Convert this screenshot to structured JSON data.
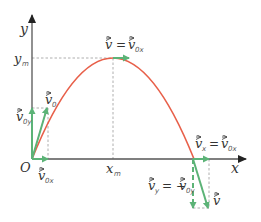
{
  "diagram": {
    "type": "projectile-motion",
    "colors": {
      "axis": "#555555",
      "trajectory": "#e8604a",
      "vector": "#5cb377",
      "guide": "#9a9a9a",
      "text": "#333333"
    },
    "axes": {
      "x_label": "x",
      "y_label": "y",
      "origin_label": "O"
    },
    "marks": {
      "x_max_label": "x",
      "x_max_sub": "m",
      "y_max_label": "y",
      "y_max_sub": "m"
    },
    "vectors": {
      "initial_velocity": {
        "main": "v",
        "sub": "0"
      },
      "initial_vx": {
        "main": "v",
        "sub": "0x"
      },
      "initial_vy": {
        "main": "v",
        "sub": "0y"
      },
      "top_equation": {
        "lhs": "v",
        "eq": "=",
        "rhs": "v",
        "rhs_sub": "0x"
      },
      "final_vx_equation": {
        "lhs": "v",
        "lhs_sub": "x",
        "eq": "=",
        "rhs": "v",
        "rhs_sub": "0x"
      },
      "final_vy_equation": {
        "lhs": "v",
        "lhs_sub": "y",
        "eq": "= −",
        "rhs": "v",
        "rhs_sub": "0y"
      },
      "final_velocity": {
        "main": "v"
      }
    }
  }
}
